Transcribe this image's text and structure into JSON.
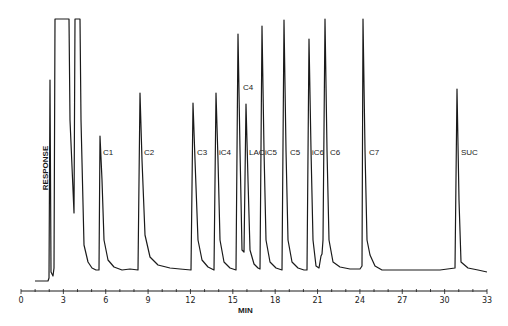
{
  "chart_data": {
    "type": "line",
    "title": "",
    "xlabel": "MIN",
    "ylabel": "RESPONSE",
    "xlim": [
      0,
      33
    ],
    "x_ticks": [
      0,
      3,
      6,
      9,
      12,
      15,
      18,
      21,
      24,
      27,
      30,
      33
    ],
    "x_tick_labels": [
      "0",
      "3",
      "6",
      "9",
      "12",
      "15",
      "18",
      21,
      "24",
      "27",
      "30",
      "33"
    ],
    "grid": false,
    "legend": null,
    "y_units": "relative response (0 = baseline, 100 = full scale)",
    "peaks": [
      {
        "label": "",
        "time": 2.1,
        "height": 76
      },
      {
        "label": "",
        "time": 2.6,
        "height": 100,
        "note": "off-scale, flat top (solvent)"
      },
      {
        "label": "",
        "time": 4.0,
        "height": 100,
        "note": "off-scale, flat top, negative dip"
      },
      {
        "label": "C1",
        "time": 5.6,
        "height": 54
      },
      {
        "label": "C2",
        "time": 8.4,
        "height": 71
      },
      {
        "label": "C3",
        "time": 12.2,
        "height": 68
      },
      {
        "label": "iC4",
        "time": 13.8,
        "height": 71
      },
      {
        "label": "C4",
        "time": 15.3,
        "height": 94
      },
      {
        "label": "LAC",
        "time": 15.9,
        "height": 67
      },
      {
        "label": "iC5",
        "time": 17.1,
        "height": 97
      },
      {
        "label": "C5",
        "time": 18.6,
        "height": 100
      },
      {
        "label": "iC6",
        "time": 20.4,
        "height": 92
      },
      {
        "label": "C6",
        "time": 21.5,
        "height": 100
      },
      {
        "label": "C7",
        "time": 24.2,
        "height": 100
      },
      {
        "label": "SUC",
        "time": 30.9,
        "height": 73
      }
    ]
  },
  "labels": {
    "ylabel": "RESPONSE",
    "xlabel": "MIN",
    "peaks": [
      "C1",
      "C2",
      "C3",
      "iC4",
      "C4",
      "LAC",
      "iC5",
      "C5",
      "iC6",
      "C6",
      "C7",
      "SUC"
    ]
  },
  "ticks": [
    "0",
    "3",
    "6",
    "9",
    "12",
    "15",
    "18",
    "21",
    "24",
    "27",
    "30",
    "33"
  ]
}
